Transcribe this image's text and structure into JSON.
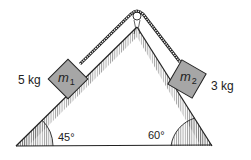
{
  "diagram": {
    "colors": {
      "line": "#222222",
      "block_fill": "#a6a6a6",
      "hatch": "#555555",
      "background": "#ffffff"
    },
    "incline_left": {
      "angle_label": "45°",
      "angle_deg": 45
    },
    "incline_right": {
      "angle_label": "60°",
      "angle_deg": 60
    },
    "mass_left": {
      "symbol": "m",
      "subscript": "1",
      "mass_label": "5 kg"
    },
    "mass_right": {
      "symbol": "m",
      "subscript": "2",
      "mass_label": "3 kg"
    },
    "pulley": {
      "icon": "pulley-icon"
    },
    "rope": {
      "icon": "rope-icon"
    }
  }
}
